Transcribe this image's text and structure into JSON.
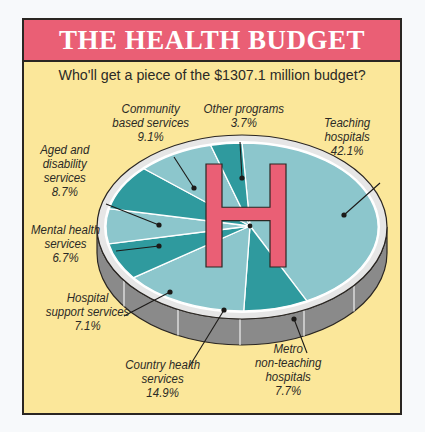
{
  "header": {
    "title": "THE HEALTH BUDGET",
    "subtitle": "Who'll get a piece of the $1307.1 million budget?"
  },
  "colors": {
    "title_band": "#ea5f75",
    "background": "#fbe79a",
    "slice_light": "#8cc6cc",
    "slice_dark": "#2f9a9e",
    "rim": "#e6e6e6",
    "cylinder_side": "#8a8a8a",
    "h_symbol": "#ea5f75"
  },
  "pie_center_symbol": "H",
  "labels": [
    {
      "id": "teaching",
      "lines": [
        "Teaching",
        "hospitals",
        "42.1%"
      ]
    },
    {
      "id": "metro",
      "lines": [
        "Metro",
        "non-teaching",
        "hospitals",
        "7.7%"
      ]
    },
    {
      "id": "country",
      "lines": [
        "Country health",
        "services",
        "14.9%"
      ]
    },
    {
      "id": "support",
      "lines": [
        "Hospital",
        "support services",
        "7.1%"
      ]
    },
    {
      "id": "mental",
      "lines": [
        "Mental health",
        "services",
        "6.7%"
      ]
    },
    {
      "id": "aged",
      "lines": [
        "Aged and",
        "disability",
        "services",
        "8.7%"
      ]
    },
    {
      "id": "community",
      "lines": [
        "Community",
        "based services",
        "9.1%"
      ]
    },
    {
      "id": "other",
      "lines": [
        "Other programs",
        "3.7%"
      ]
    }
  ],
  "chart_data": {
    "type": "pie",
    "title": "THE HEALTH BUDGET",
    "subtitle": "Who'll get a piece of the $1307.1 million budget?",
    "total": 1307.1,
    "unit": "$ million",
    "categories": [
      "Teaching hospitals",
      "Metro non-teaching hospitals",
      "Country health services",
      "Hospital support services",
      "Mental health services",
      "Aged and disability services",
      "Community based services",
      "Other programs"
    ],
    "values": [
      42.1,
      7.7,
      14.9,
      7.1,
      6.7,
      8.7,
      9.1,
      3.7
    ],
    "value_format": "percent",
    "style": "3d pie (cylinder) with alternating teal shades and red H symbol in center",
    "legend": "none (callout labels with leader lines)"
  }
}
